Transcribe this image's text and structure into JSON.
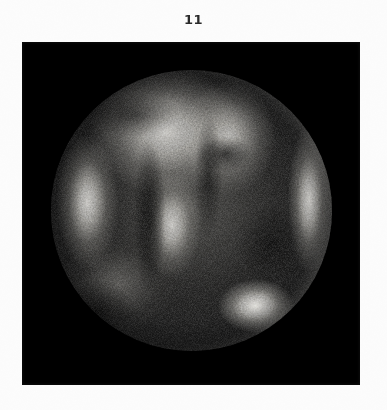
{
  "page": {
    "background_color": "#fcfcfc",
    "width": 387,
    "height": 410
  },
  "figure": {
    "label": "11",
    "label_color": "#2a2a2a"
  },
  "plate": {
    "name": "black-image-plate",
    "background_color": "#000000",
    "left": 22,
    "top": 42,
    "width": 338,
    "height": 343
  },
  "scan": {
    "modality_appearance": "grayscale circular field-of-view medical scan",
    "circle_center_x": 191,
    "circle_center_y": 210,
    "circle_radius": 140,
    "background_color": "#141414",
    "features": [
      {
        "name": "bright-patch-upper-left",
        "position": "41% 22%"
      },
      {
        "name": "bright-patch-upper-right",
        "position": "63% 24%"
      },
      {
        "name": "bright-band-left-margin",
        "position": "13% 47%"
      },
      {
        "name": "bright-rim-arc-right",
        "position": "92% 46%"
      },
      {
        "name": "bright-patch-center",
        "position": "43% 55%"
      },
      {
        "name": "bright-lesion-lower-right",
        "position": "73% 84%"
      },
      {
        "name": "dark-fissure-center",
        "position": "35% 52%"
      },
      {
        "name": "dark-region-lower-left",
        "position": "24% 76%"
      }
    ]
  }
}
